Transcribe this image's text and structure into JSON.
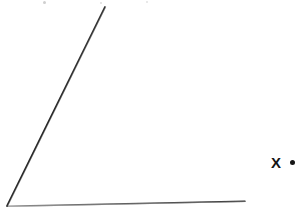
{
  "figure": {
    "type": "geometry-angle-diagram",
    "width": 306,
    "height": 211,
    "background_color": "#ffffff",
    "stroke_color": "#2a2a2a",
    "vertex": {
      "x": 7,
      "y": 206
    },
    "rays": [
      {
        "name": "diagonal-ray",
        "from": {
          "x": 7,
          "y": 206
        },
        "to": {
          "x": 105,
          "y": 7
        },
        "stroke_width": 1.6,
        "color": "#222222"
      },
      {
        "name": "horizontal-ray",
        "from": {
          "x": 7,
          "y": 206
        },
        "to": {
          "x": 245,
          "y": 201
        },
        "stroke_width": 1.5,
        "color": "#3a3a3a"
      }
    ],
    "labels": [
      {
        "name": "point-label-x",
        "text": "X",
        "x": 276,
        "y": 163,
        "color": "#151515",
        "font_size": 15,
        "bold": true
      }
    ],
    "markers": [
      {
        "name": "bullet-dot",
        "shape": "filled-circle",
        "x": 293,
        "y": 163,
        "radius": 2.5,
        "color": "#151515"
      }
    ],
    "artifacts": [
      {
        "name": "scan-speck",
        "x": 44,
        "y": 2,
        "color": "#cfcfcf"
      },
      {
        "name": "scan-speck",
        "x": 101,
        "y": 3,
        "color": "#dcdcdc"
      },
      {
        "name": "scan-speck",
        "x": 147,
        "y": 2,
        "color": "#e2e2e2"
      }
    ]
  }
}
